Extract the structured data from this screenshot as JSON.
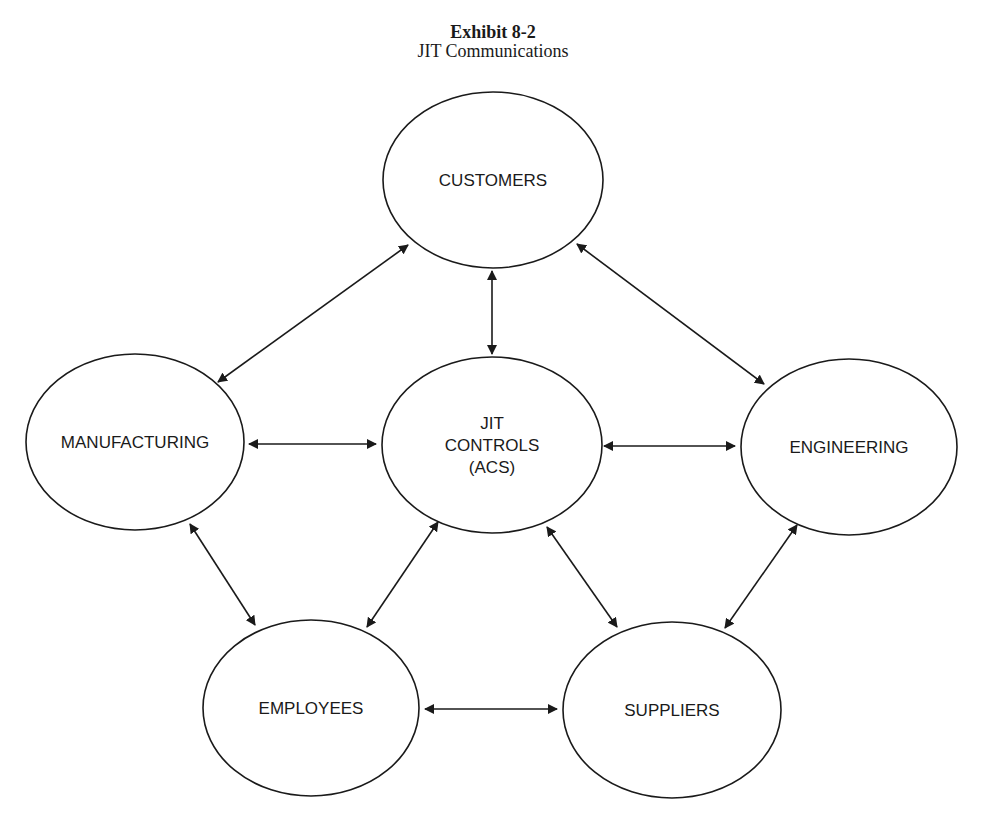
{
  "header": {
    "title": "Exhibit 8-2",
    "subtitle": "JIT Communications"
  },
  "colors": {
    "ink": "#1a1a1a",
    "background": "#ffffff"
  },
  "nodes": [
    {
      "id": "customers",
      "lines": [
        "CUSTOMERS"
      ],
      "cx": 493,
      "cy": 180,
      "rx": 110,
      "ry": 88
    },
    {
      "id": "manufacturing",
      "lines": [
        "MANUFACTURING"
      ],
      "cx": 135,
      "cy": 442,
      "rx": 109,
      "ry": 88
    },
    {
      "id": "jit-controls",
      "lines": [
        "JIT",
        "CONTROLS",
        "(ACS)"
      ],
      "cx": 492,
      "cy": 445,
      "rx": 110,
      "ry": 88
    },
    {
      "id": "engineering",
      "lines": [
        "ENGINEERING"
      ],
      "cx": 849,
      "cy": 447,
      "rx": 108,
      "ry": 88
    },
    {
      "id": "employees",
      "lines": [
        "EMPLOYEES"
      ],
      "cx": 311,
      "cy": 708,
      "rx": 108,
      "ry": 88
    },
    {
      "id": "suppliers",
      "lines": [
        "SUPPLIERS"
      ],
      "cx": 672,
      "cy": 710,
      "rx": 109,
      "ry": 88
    }
  ],
  "edges": [
    {
      "from": "manufacturing",
      "to": "customers",
      "x1": 218,
      "y1": 382,
      "x2": 408,
      "y2": 245,
      "bidirectional": true
    },
    {
      "from": "customers",
      "to": "jit-controls",
      "x1": 492,
      "y1": 271,
      "x2": 492,
      "y2": 354,
      "bidirectional": true
    },
    {
      "from": "customers",
      "to": "engineering",
      "x1": 577,
      "y1": 244,
      "x2": 764,
      "y2": 384,
      "bidirectional": true
    },
    {
      "from": "manufacturing",
      "to": "jit-controls",
      "x1": 249,
      "y1": 444,
      "x2": 376,
      "y2": 444,
      "bidirectional": true
    },
    {
      "from": "jit-controls",
      "to": "engineering",
      "x1": 604,
      "y1": 446,
      "x2": 735,
      "y2": 446,
      "bidirectional": true
    },
    {
      "from": "manufacturing",
      "to": "employees",
      "x1": 190,
      "y1": 524,
      "x2": 255,
      "y2": 625,
      "bidirectional": true
    },
    {
      "from": "jit-controls",
      "to": "employees",
      "x1": 438,
      "y1": 522,
      "x2": 367,
      "y2": 627,
      "bidirectional": true
    },
    {
      "from": "jit-controls",
      "to": "suppliers",
      "x1": 547,
      "y1": 527,
      "x2": 617,
      "y2": 627,
      "bidirectional": true
    },
    {
      "from": "engineering",
      "to": "suppliers",
      "x1": 797,
      "y1": 525,
      "x2": 725,
      "y2": 628,
      "bidirectional": true
    },
    {
      "from": "employees",
      "to": "suppliers",
      "x1": 425,
      "y1": 709,
      "x2": 557,
      "y2": 709,
      "bidirectional": true
    }
  ]
}
